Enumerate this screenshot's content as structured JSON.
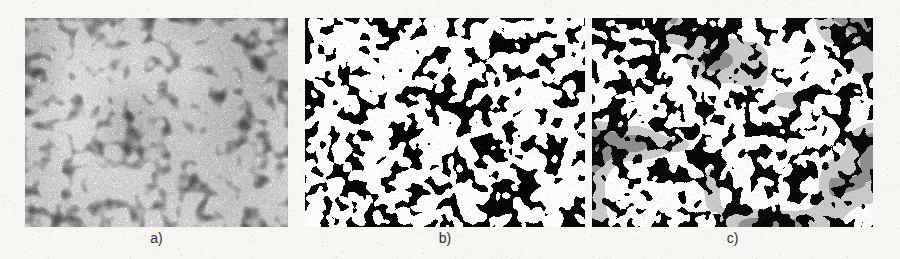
{
  "figure": {
    "caption_style": "panel letters below each image",
    "background_color": "#f7f5f1",
    "label_color": "#2b2b2b",
    "panels": [
      {
        "id": "panel-a",
        "label": "a)",
        "kind": "grayscale-micrograph",
        "description": "original grayscale SEM micrograph of densely packed rounded grains",
        "x": 25,
        "y": 18,
        "width": 263,
        "height": 209,
        "label_x": 25,
        "label_y": 231,
        "label_width": 263,
        "palette": {
          "background": "#4a4a4a",
          "mid": "#8a8a8a",
          "grain": "#b9b9b9",
          "highlight": "#efefef",
          "shadow": "#2e2e2e"
        },
        "render": {
          "mode": "gray",
          "seed": 10117,
          "blob_count": 1500,
          "blob_radius_min": 3.0,
          "blob_radius_max": 7.5,
          "blur_px": 1.6,
          "grain_amount": 26,
          "contrast": 0.62,
          "base_level": 78
        }
      },
      {
        "id": "panel-b",
        "label": "b)",
        "kind": "binary-threshold-mask",
        "description": "binary segmentation mask, white particles on black background",
        "x": 305,
        "y": 18,
        "width": 280,
        "height": 209,
        "label_x": 305,
        "label_y": 231,
        "label_width": 280,
        "palette": {
          "background": "#050505",
          "object": "#fbfbfb"
        },
        "render": {
          "mode": "binary",
          "seed": 48213,
          "blob_count": 980,
          "blob_radius_min": 2.6,
          "blob_radius_max": 6.2,
          "blur_px": 0.9,
          "threshold": 128,
          "grain_amount": 14
        }
      },
      {
        "id": "panel-c",
        "label": "c)",
        "kind": "multiclass-labelled-segmentation",
        "description": "classified segmentation with several grey levels marking different particle classes",
        "x": 592,
        "y": 18,
        "width": 281,
        "height": 209,
        "label_x": 592,
        "label_y": 231,
        "label_width": 281,
        "palette": {
          "background": "#090909",
          "class_1_white": "#fafafa",
          "class_2_light_grey": "#c8c8c8",
          "class_3_mid_grey": "#8e8e8e",
          "class_4_dark_grey": "#5a5a5a"
        },
        "render": {
          "mode": "multiclass",
          "seed": 7703,
          "blob_count": 900,
          "blob_radius_min": 2.6,
          "blob_radius_max": 6.2,
          "blur_px": 0.9,
          "threshold": 128,
          "grain_amount": 14,
          "class_weights": [
            0.58,
            0.18,
            0.16,
            0.08
          ],
          "patch_count": 7
        }
      }
    ]
  },
  "page_noise": {
    "speckle_color": "#b9b4ab",
    "density": 0.012
  }
}
